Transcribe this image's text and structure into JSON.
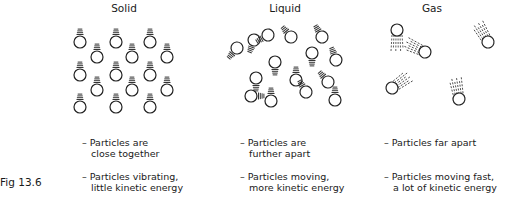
{
  "figure_label": "Fig 13.6",
  "states": [
    {
      "name": "Solid",
      "captions": [
        "– Particles are\n   close together",
        "– Particles vibrating,\n   little kinetic energy"
      ],
      "particles": [
        [
          80,
          42
        ],
        [
          116,
          42
        ],
        [
          150,
          42
        ],
        [
          97,
          57
        ],
        [
          132,
          57
        ],
        [
          167,
          57
        ],
        [
          80,
          75
        ],
        [
          116,
          75
        ],
        [
          150,
          75
        ],
        [
          97,
          90
        ],
        [
          132,
          90
        ],
        [
          167,
          90
        ],
        [
          80,
          107
        ],
        [
          116,
          107
        ],
        [
          150,
          107
        ]
      ]
    },
    {
      "name": "Liquid",
      "captions": [
        "– Particles are\n   further apart",
        "– Particles moving,\n   more kinetic energy"
      ],
      "particles": [
        [
          254,
          40,
          -160
        ],
        [
          268,
          35,
          -120
        ],
        [
          291,
          37,
          -40
        ],
        [
          322,
          37,
          -30
        ],
        [
          237,
          48,
          -140
        ],
        [
          275,
          62,
          180
        ],
        [
          312,
          53,
          180
        ],
        [
          336,
          60,
          -20
        ],
        [
          256,
          78,
          180
        ],
        [
          296,
          80,
          0
        ],
        [
          328,
          82,
          -40
        ],
        [
          251,
          96,
          90
        ],
        [
          271,
          101,
          0
        ],
        [
          306,
          92,
          -30
        ],
        [
          335,
          100,
          0
        ]
      ]
    },
    {
      "name": "Gas",
      "captions": [
        "– Particles far apart",
        "– Particles moving fast,\n   a lot of kinetic energy"
      ],
      "particles": [
        [
          397,
          30,
          180
        ],
        [
          425,
          52,
          -65
        ],
        [
          488,
          42,
          -30
        ],
        [
          392,
          88,
          55
        ],
        [
          459,
          99,
          -10
        ]
      ]
    }
  ],
  "titles": {
    "solid": "Solid",
    "liquid": "Liquid",
    "gas": "Gas"
  },
  "captions": {
    "solid_1": "– Particles are\n   close together",
    "solid_2": "– Particles vibrating,\n   little kinetic energy",
    "liquid_1": "– Particles are\n   further apart",
    "liquid_2": "– Particles moving,\n   more kinetic energy",
    "gas_1": "– Particles far apart",
    "gas_2": "– Particles moving fast,\n   a lot of kinetic energy"
  }
}
